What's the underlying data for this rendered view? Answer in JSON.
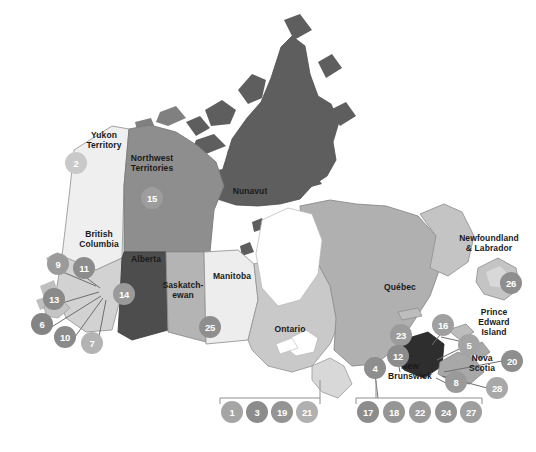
{
  "background_color": "#ffffff",
  "provinces": [
    {
      "id": "yukon",
      "name": "Yukon\nTerritory",
      "label_x": 104,
      "label_y": 140,
      "fill": "#efefef",
      "stroke": "#9a9a9a"
    },
    {
      "id": "northwest-territories",
      "name": "Northwest\nTerritories",
      "label_x": 152,
      "label_y": 163,
      "fill": "#8e8e8e",
      "stroke": "#7a7a7a"
    },
    {
      "id": "nunavut",
      "name": "Nunavut",
      "label_x": 250,
      "label_y": 196,
      "fill": "#5e5e5e",
      "stroke": "#4e4e4e"
    },
    {
      "id": "british-columbia",
      "name": "British\nColumbia",
      "label_x": 99,
      "label_y": 239,
      "fill": "#d2d2d2",
      "stroke": "#9a9a9a"
    },
    {
      "id": "alberta",
      "name": "Alberta",
      "label_x": 146,
      "label_y": 264,
      "fill": "#4d4d4d",
      "stroke": "#3f3f3f"
    },
    {
      "id": "saskatchewan",
      "name": "Saskatch-\newan",
      "label_x": 183,
      "label_y": 290,
      "fill": "#b4b4b4",
      "stroke": "#909090"
    },
    {
      "id": "manitoba",
      "name": "Manitoba",
      "label_x": 232,
      "label_y": 281,
      "fill": "#ededed",
      "stroke": "#969696"
    },
    {
      "id": "ontario",
      "name": "Ontario",
      "label_x": 290,
      "label_y": 334,
      "fill": "#c9c9c9",
      "stroke": "#9a9a9a"
    },
    {
      "id": "quebec",
      "name": "Québec",
      "label_x": 400,
      "label_y": 292,
      "fill": "#b0b0b0",
      "stroke": "#8a8a8a"
    },
    {
      "id": "newfoundland-labrador",
      "name": "Newfoundland\n& Labrador",
      "label_x": 489,
      "label_y": 243,
      "fill": "#c4c4c4",
      "stroke": "#949494"
    },
    {
      "id": "prince-edward-island",
      "name": "Prince\nEdward\nIsland",
      "label_x": 494,
      "label_y": 317,
      "fill": "#bdbdbd",
      "stroke": "#8a8a8a"
    },
    {
      "id": "new-brunswick",
      "name": "New\nBrunswick",
      "label_x": 410,
      "label_y": 371,
      "fill": "#2e2e2e",
      "stroke": "#222222"
    },
    {
      "id": "nova-scotia",
      "name": "Nova\nScotia",
      "label_x": 482,
      "label_y": 363,
      "fill": "#a8a8a8",
      "stroke": "#868686"
    }
  ],
  "markers": [
    {
      "num": "2",
      "x": 76,
      "y": 163,
      "r": 11,
      "fill": "#c9c9c9",
      "region": "yukon"
    },
    {
      "num": "15",
      "x": 152,
      "y": 198,
      "r": 11,
      "fill": "#9d9d9d",
      "region": "northwest-territories"
    },
    {
      "num": "9",
      "x": 58,
      "y": 264,
      "r": 11,
      "fill": "#9b9b9b",
      "region": "british-columbia"
    },
    {
      "num": "11",
      "x": 84,
      "y": 268,
      "r": 11,
      "fill": "#8c8c8c",
      "region": "british-columbia"
    },
    {
      "num": "13",
      "x": 54,
      "y": 299,
      "r": 11,
      "fill": "#8a8a8a",
      "region": "british-columbia"
    },
    {
      "num": "6",
      "x": 42,
      "y": 324,
      "r": 11,
      "fill": "#848484",
      "region": "british-columbia"
    },
    {
      "num": "10",
      "x": 65,
      "y": 337,
      "r": 11,
      "fill": "#8a8a8a",
      "region": "british-columbia"
    },
    {
      "num": "7",
      "x": 92,
      "y": 343,
      "r": 11,
      "fill": "#b3b3b3",
      "region": "british-columbia"
    },
    {
      "num": "14",
      "x": 124,
      "y": 294,
      "r": 11,
      "fill": "#9a9a9a",
      "region": "alberta"
    },
    {
      "num": "25",
      "x": 210,
      "y": 327,
      "r": 11,
      "fill": "#8e8e8e",
      "region": "manitoba"
    },
    {
      "num": "26",
      "x": 511,
      "y": 283,
      "r": 11,
      "fill": "#8e8e8e",
      "region": "newfoundland-labrador"
    },
    {
      "num": "16",
      "x": 443,
      "y": 325,
      "r": 11,
      "fill": "#a0a0a0",
      "region": "nova-scotia"
    },
    {
      "num": "23",
      "x": 401,
      "y": 335,
      "r": 11,
      "fill": "#9b9b9b",
      "region": "quebec"
    },
    {
      "num": "12",
      "x": 398,
      "y": 356,
      "r": 11,
      "fill": "#8c8c8c",
      "region": "quebec"
    },
    {
      "num": "5",
      "x": 469,
      "y": 345,
      "r": 11,
      "fill": "#a4a4a4",
      "region": "prince-edward-island"
    },
    {
      "num": "20",
      "x": 512,
      "y": 361,
      "r": 11,
      "fill": "#8e8e8e",
      "region": "nova-scotia"
    },
    {
      "num": "4",
      "x": 375,
      "y": 368,
      "r": 11,
      "fill": "#8e8e8e",
      "region": "ontario"
    },
    {
      "num": "8",
      "x": 456,
      "y": 382,
      "r": 11,
      "fill": "#9a9a9a",
      "region": "nova-scotia"
    },
    {
      "num": "28",
      "x": 497,
      "y": 388,
      "r": 11,
      "fill": "#a8a8a8",
      "region": "nova-scotia"
    }
  ],
  "legend_groups": [
    {
      "id": "legend-group-left",
      "bracket": {
        "x": 220,
        "y": 398,
        "width": 100,
        "height": 6
      },
      "stem": {
        "x": 320,
        "y": 380,
        "height": 18
      },
      "items": [
        {
          "num": "1",
          "x": 232,
          "y": 412,
          "r": 11,
          "fill": "#a5a5a5"
        },
        {
          "num": "3",
          "x": 257,
          "y": 412,
          "r": 11,
          "fill": "#8c8c8c"
        },
        {
          "num": "19",
          "x": 282,
          "y": 412,
          "r": 11,
          "fill": "#949494"
        },
        {
          "num": "21",
          "x": 307,
          "y": 412,
          "r": 11,
          "fill": "#b0b0b0"
        }
      ]
    },
    {
      "id": "legend-group-right",
      "bracket": {
        "x": 356,
        "y": 398,
        "width": 126,
        "height": 6
      },
      "stem": {
        "x": 376,
        "y": 380,
        "height": 18
      },
      "items": [
        {
          "num": "17",
          "x": 368,
          "y": 412,
          "r": 11,
          "fill": "#8c8c8c"
        },
        {
          "num": "18",
          "x": 394,
          "y": 412,
          "r": 11,
          "fill": "#969696"
        },
        {
          "num": "22",
          "x": 420,
          "y": 412,
          "r": 11,
          "fill": "#9a9a9a"
        },
        {
          "num": "24",
          "x": 446,
          "y": 412,
          "r": 11,
          "fill": "#929292"
        },
        {
          "num": "27",
          "x": 471,
          "y": 412,
          "r": 11,
          "fill": "#9e9e9e"
        }
      ]
    }
  ],
  "leader_lines": [
    {
      "from": [
        58,
        270
      ],
      "to": [
        96,
        286
      ]
    },
    {
      "from": [
        84,
        276
      ],
      "to": [
        100,
        288
      ]
    },
    {
      "from": [
        62,
        303
      ],
      "to": [
        99,
        292
      ]
    },
    {
      "from": [
        50,
        328
      ],
      "to": [
        101,
        296
      ]
    },
    {
      "from": [
        72,
        341
      ],
      "to": [
        103,
        298
      ]
    },
    {
      "from": [
        97,
        347
      ],
      "to": [
        106,
        300
      ]
    },
    {
      "from": [
        401,
        341
      ],
      "to": [
        406,
        364
      ]
    },
    {
      "from": [
        398,
        362
      ],
      "to": [
        400,
        372
      ]
    },
    {
      "from": [
        443,
        331
      ],
      "to": [
        432,
        345
      ]
    },
    {
      "from": [
        459,
        341
      ],
      "to": [
        441,
        337
      ]
    },
    {
      "from": [
        461,
        348
      ],
      "to": [
        437,
        360
      ]
    },
    {
      "from": [
        502,
        361
      ],
      "to": [
        444,
        372
      ]
    },
    {
      "from": [
        487,
        388
      ],
      "to": [
        442,
        376
      ]
    },
    {
      "from": [
        456,
        388
      ],
      "to": [
        436,
        378
      ]
    },
    {
      "from": [
        375,
        374
      ],
      "to": [
        378,
        398
      ]
    }
  ],
  "colors": {
    "label_text": "#1a1a1a",
    "marker_text": "#ffffff",
    "leader_line": "#6e6e6e",
    "bracket": "#8f8f8f"
  }
}
